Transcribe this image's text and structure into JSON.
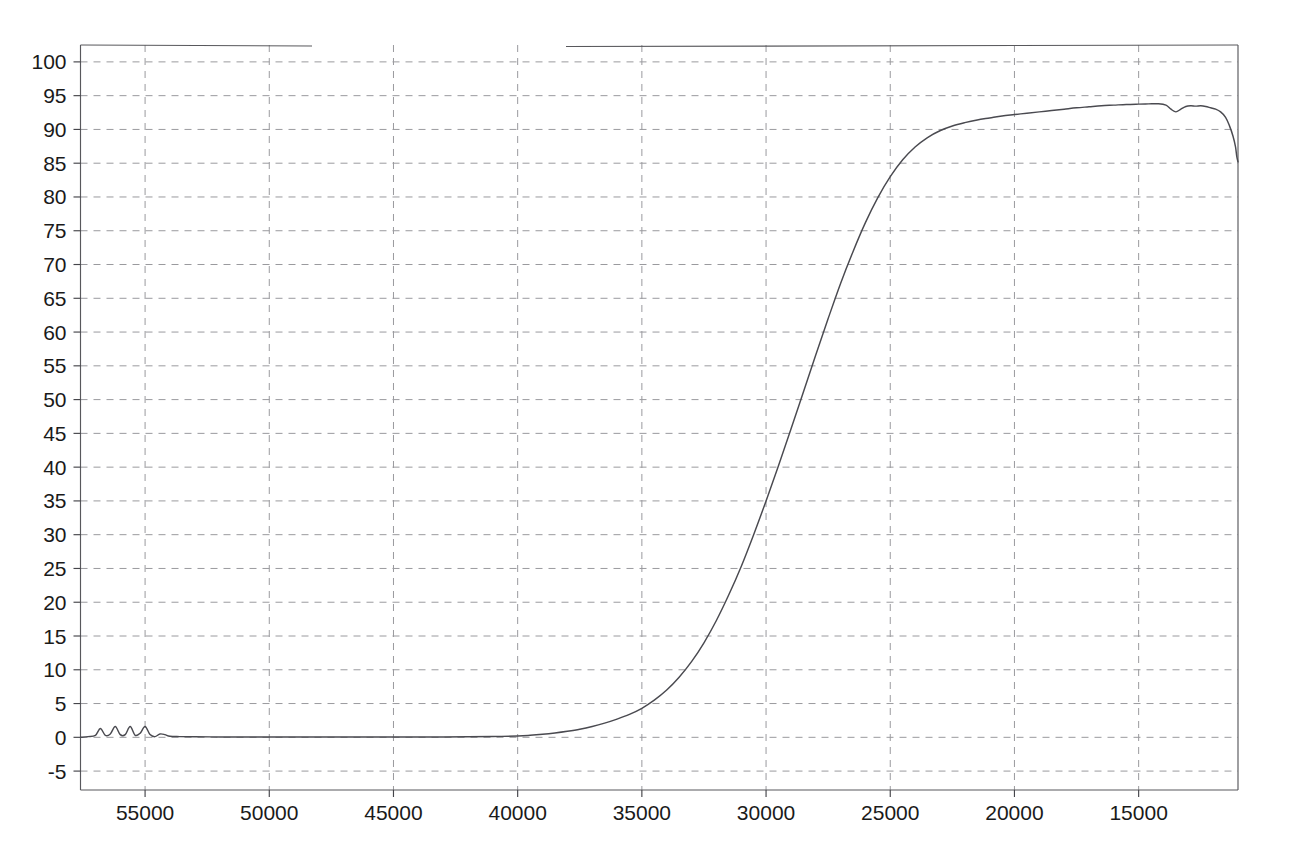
{
  "chart_data": {
    "type": "line",
    "title": "",
    "subtitle": "",
    "xlabel": "",
    "ylabel": "",
    "xlim": [
      57600,
      11000
    ],
    "ylim": [
      -7.8,
      102.5
    ],
    "x_axis_reversed": true,
    "grid": true,
    "legend": null,
    "xticks": [
      55000,
      50000,
      45000,
      40000,
      35000,
      30000,
      25000,
      20000,
      15000
    ],
    "xtick_labels": [
      "55000",
      "50000",
      "45000",
      "40000",
      "35000",
      "30000",
      "25000",
      "20000",
      "15000"
    ],
    "yticks": [
      100,
      95,
      90,
      85,
      80,
      75,
      70,
      65,
      60,
      55,
      50,
      45,
      40,
      35,
      30,
      25,
      20,
      15,
      10,
      5,
      0,
      -5
    ],
    "ytick_labels": [
      "100",
      "95",
      "90",
      "85",
      "80",
      "75",
      "70",
      "65",
      "60",
      "55",
      "50",
      "45",
      "40",
      "35",
      "30",
      "25",
      "20",
      "15",
      "10",
      "5",
      "0",
      "-5"
    ],
    "series": [
      {
        "name": "transmittance",
        "color": "#4a4a50",
        "x": [
          57600,
          57300,
          57000,
          56800,
          56600,
          56400,
          56200,
          56000,
          55800,
          55600,
          55400,
          55200,
          55000,
          54800,
          54600,
          54400,
          54200,
          54000,
          53600,
          53000,
          52000,
          51000,
          50000,
          49000,
          48000,
          47000,
          46000,
          45000,
          44000,
          43000,
          42000,
          41000,
          40000,
          39500,
          39000,
          38500,
          38000,
          37500,
          37000,
          36500,
          36000,
          35500,
          35000,
          34500,
          34000,
          33500,
          33000,
          32500,
          32000,
          31500,
          31000,
          30500,
          30000,
          29500,
          29000,
          28500,
          28000,
          27500,
          27000,
          26500,
          26000,
          25500,
          25000,
          24500,
          24000,
          23500,
          23000,
          22500,
          22000,
          21500,
          21000,
          20500,
          20000,
          19500,
          19000,
          18500,
          18000,
          17500,
          17000,
          16500,
          16000,
          15500,
          15000,
          14600,
          14200,
          13900,
          13700,
          13500,
          13300,
          13100,
          12900,
          12700,
          12500,
          12300,
          12100,
          11900,
          11700,
          11500,
          11350,
          11200,
          11100,
          11050,
          11000
        ],
        "y": [
          0.0,
          0.1,
          0.3,
          1.3,
          0.3,
          0.5,
          1.6,
          0.4,
          0.4,
          1.6,
          0.3,
          0.6,
          1.6,
          0.4,
          0.1,
          0.5,
          0.4,
          0.15,
          0.1,
          0.08,
          0.06,
          0.06,
          0.05,
          0.05,
          0.05,
          0.05,
          0.05,
          0.05,
          0.05,
          0.06,
          0.08,
          0.12,
          0.2,
          0.3,
          0.45,
          0.65,
          0.9,
          1.2,
          1.6,
          2.1,
          2.7,
          3.4,
          4.3,
          5.5,
          7.0,
          8.9,
          11.2,
          14.0,
          17.3,
          21.1,
          25.3,
          30.0,
          35.0,
          40.2,
          45.6,
          51.1,
          56.6,
          62.0,
          67.2,
          71.9,
          76.2,
          79.9,
          83.0,
          85.5,
          87.4,
          88.8,
          89.8,
          90.5,
          91.0,
          91.4,
          91.7,
          92.0,
          92.2,
          92.4,
          92.6,
          92.8,
          93.0,
          93.2,
          93.35,
          93.5,
          93.6,
          93.7,
          93.75,
          93.78,
          93.8,
          93.6,
          93.0,
          92.6,
          93.0,
          93.4,
          93.5,
          93.45,
          93.5,
          93.4,
          93.2,
          93.0,
          92.6,
          91.8,
          90.6,
          89.0,
          87.4,
          86.0,
          85.2
        ]
      }
    ],
    "annotations": []
  }
}
